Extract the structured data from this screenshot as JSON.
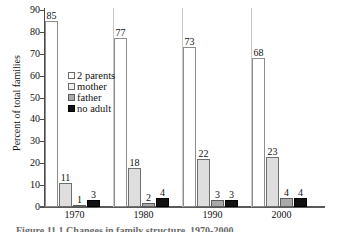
{
  "chart_data": {
    "type": "bar",
    "title": "",
    "xlabel": "",
    "ylabel": "Percent of total families",
    "ylim": [
      0,
      90
    ],
    "ytick_step": 10,
    "yticks": [
      "0",
      "10",
      "20",
      "30",
      "40",
      "50",
      "60",
      "70",
      "80",
      "90"
    ],
    "categories": [
      "1970",
      "1980",
      "1990",
      "2000"
    ],
    "grid": false,
    "legend_position": "inside-upper-center-left",
    "series": [
      {
        "name": "2 parents",
        "values": [
          85,
          77,
          73,
          68
        ],
        "color": "#ffffff"
      },
      {
        "name": "mother",
        "values": [
          11,
          18,
          22,
          23
        ],
        "color": "#dedede"
      },
      {
        "name": "father",
        "values": [
          1,
          2,
          3,
          4
        ],
        "color": "#a9a9a9"
      },
      {
        "name": "no adult",
        "values": [
          3,
          4,
          3,
          4
        ],
        "color": "#111111"
      }
    ],
    "data_labels": [
      [
        "85",
        "11",
        "1",
        "3"
      ],
      [
        "77",
        "18",
        "2",
        "4"
      ],
      [
        "73",
        "22",
        "3",
        "3"
      ],
      [
        "68",
        "23",
        "4",
        "4"
      ]
    ]
  },
  "caption": {
    "text": "Figure 11.1  Changes in family structure, 1970-2000"
  },
  "axis": {
    "y_title": "Percent of total families"
  }
}
